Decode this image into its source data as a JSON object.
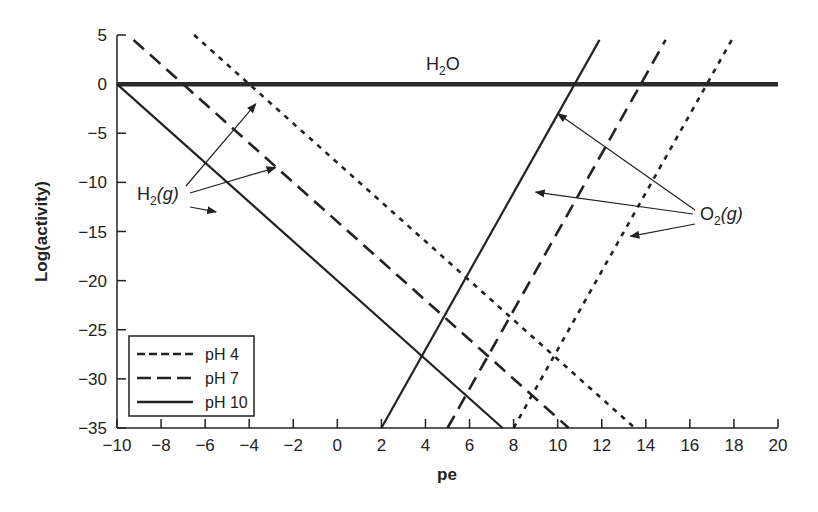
{
  "chart_data": {
    "type": "line",
    "title": "",
    "xlabel": "pe",
    "ylabel": "Log(activity)",
    "xlim": [
      -10,
      20
    ],
    "ylim": [
      -35,
      5
    ],
    "xticks": [
      -10,
      -8,
      -6,
      -4,
      -2,
      0,
      2,
      4,
      6,
      8,
      10,
      12,
      14,
      16,
      18,
      20
    ],
    "yticks": [
      5,
      0,
      -5,
      -10,
      -15,
      -20,
      -25,
      -30,
      -35
    ],
    "grid": false,
    "legend_position": "lower-left",
    "legend": [
      {
        "label": "pH 4",
        "style": "short-dash"
      },
      {
        "label": "pH 7",
        "style": "long-dash"
      },
      {
        "label": "pH 10",
        "style": "solid"
      }
    ],
    "series": [
      {
        "name": "H2O",
        "style": "thick-solid",
        "x": [
          -10,
          20
        ],
        "y": [
          0,
          0
        ]
      },
      {
        "name": "H2(g) pH 4",
        "style": "short-dash",
        "x": [
          -6.5,
          13.5
        ],
        "y": [
          5,
          -35
        ]
      },
      {
        "name": "H2(g) pH 7",
        "style": "long-dash",
        "x": [
          -9.25,
          10.5
        ],
        "y": [
          4.5,
          -35
        ]
      },
      {
        "name": "H2(g) pH 10",
        "style": "solid",
        "x": [
          -10,
          7.5
        ],
        "y": [
          0,
          -35
        ]
      },
      {
        "name": "O2(g) pH 4",
        "style": "short-dash",
        "x": [
          8.0,
          17.9
        ],
        "y": [
          -35,
          4.5
        ]
      },
      {
        "name": "O2(g) pH 7",
        "style": "long-dash",
        "x": [
          5.0,
          14.9
        ],
        "y": [
          -35,
          4.5
        ]
      },
      {
        "name": "O2(g) pH 10",
        "style": "solid",
        "x": [
          2.0,
          11.9
        ],
        "y": [
          -35,
          4.5
        ]
      }
    ],
    "annotations": [
      {
        "text": "H2O",
        "x": 3.5,
        "y": 2.5
      },
      {
        "text": "H2(g)",
        "x": -7.5,
        "y": -11.5,
        "arrows_to": [
          [
            -3.7,
            -2
          ],
          [
            -2.8,
            -8.5
          ],
          [
            -5.5,
            -13
          ]
        ]
      },
      {
        "text": "O2(g)",
        "x": 15.5,
        "y": -14,
        "arrows_to": [
          [
            10.0,
            -3
          ],
          [
            9.0,
            -11
          ],
          [
            13.3,
            -15.5
          ]
        ]
      }
    ]
  },
  "labels": {
    "h2o": "H",
    "h2o_sub": "2",
    "h2o_tail": "O",
    "h2": "H",
    "h2_sub": "2",
    "h2_tail": "(g)",
    "o2": "O",
    "o2_sub": "2",
    "o2_tail": "(g)"
  }
}
